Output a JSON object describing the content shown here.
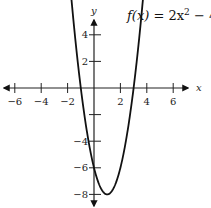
{
  "chart_data": {
    "type": "line",
    "function": {
      "a": 2,
      "b": -4,
      "c": -6
    },
    "xlabel": "x",
    "ylabel": "y",
    "xlim": [
      -7,
      7
    ],
    "ylim": [
      -8.5,
      5.5
    ],
    "x_ticks": [
      -6,
      -4,
      -2,
      2,
      4,
      6
    ],
    "x_tick_labels": [
      "−6",
      "−4",
      "−2",
      "2",
      "4",
      "6"
    ],
    "y_ticks": [
      4,
      2,
      -4,
      -6,
      -8
    ],
    "y_tick_labels": [
      "4",
      "2",
      "−4",
      "−6",
      "−8"
    ],
    "y_unlabeled_ticks": [
      -2
    ],
    "x_range_plotted": [
      -1.85,
      3.85
    ],
    "vertex": [
      1,
      -8
    ],
    "roots": [
      -1,
      3
    ],
    "y_intercept": -6,
    "grid": false
  }
}
